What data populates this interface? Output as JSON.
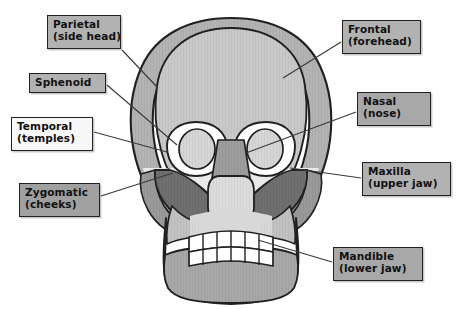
{
  "figure": {
    "width": 462,
    "height": 309,
    "background_color": "#ffffff"
  },
  "palette": {
    "outline": "#231f20",
    "leader_line": "#3a3a3a",
    "label_fill_gray": "#b2b2b2",
    "label_fill_dark_gray": "#a0a0a0",
    "label_fill_white": "#f7f7f7",
    "label_text": "#111111",
    "bone_frontal": "#c9c9c9",
    "bone_parietal": "#b3b3b3",
    "bone_temporal": "#9a9a9a",
    "bone_sphenoid": "#8c8c8c",
    "bone_zygomatic": "#6f6f6f",
    "bone_nasal": "#9d9d9d",
    "bone_maxilla": "#c2c2c2",
    "bone_mandible": "#a8a8a8",
    "orbit_rim": "#ffffff",
    "orbit_interior": "#d6d6d6",
    "teeth": "#ffffff"
  },
  "labels": [
    {
      "id": "parietal",
      "name": "Parietal",
      "common": "(side head)",
      "fill": "#b2b2b2",
      "x": 47,
      "y": 15,
      "width": 74,
      "height": 34
    },
    {
      "id": "sphenoid",
      "name": "Sphenoid",
      "common": "",
      "fill": "#b2b2b2",
      "x": 29,
      "y": 73,
      "width": 77,
      "height": 20
    },
    {
      "id": "temporal",
      "name": "Temporal",
      "common": "(temples)",
      "fill": "#f7f7f7",
      "x": 11,
      "y": 117,
      "width": 82,
      "height": 34
    },
    {
      "id": "zygomatic",
      "name": "Zygomatic",
      "common": "(cheeks)",
      "fill": "#a0a0a0",
      "x": 19,
      "y": 183,
      "width": 81,
      "height": 34
    },
    {
      "id": "frontal",
      "name": "Frontal",
      "common": "(forehead)",
      "fill": "#b2b2b2",
      "x": 342,
      "y": 20,
      "width": 79,
      "height": 34
    },
    {
      "id": "nasal",
      "name": "Nasal",
      "common": "(nose)",
      "fill": "#a8a8a8",
      "x": 357,
      "y": 92,
      "width": 74,
      "height": 34
    },
    {
      "id": "maxilla",
      "name": "Maxilla",
      "common": "(upper jaw)",
      "fill": "#b2b2b2",
      "x": 362,
      "y": 162,
      "width": 89,
      "height": 34
    },
    {
      "id": "mandible",
      "name": "Mandible",
      "common": "(lower jaw)",
      "fill": "#a8a8a8",
      "x": 333,
      "y": 247,
      "width": 90,
      "height": 34
    }
  ],
  "leader_lines": [
    {
      "id": "parietal-leader",
      "x1": 122,
      "y1": 50,
      "x2": 158,
      "y2": 88
    },
    {
      "id": "sphenoid-leader",
      "x1": 107,
      "y1": 85,
      "x2": 177,
      "y2": 145
    },
    {
      "id": "temporal-leader",
      "x1": 94,
      "y1": 132,
      "x2": 167,
      "y2": 152
    },
    {
      "id": "zygomatic-leader",
      "x1": 101,
      "y1": 196,
      "x2": 173,
      "y2": 173
    },
    {
      "id": "frontal-leader",
      "x1": 341,
      "y1": 42,
      "x2": 283,
      "y2": 78
    },
    {
      "id": "nasal-leader",
      "x1": 356,
      "y1": 112,
      "x2": 246,
      "y2": 153
    },
    {
      "id": "maxilla-leader",
      "x1": 361,
      "y1": 178,
      "x2": 290,
      "y2": 168
    },
    {
      "id": "mandible-leader",
      "x1": 332,
      "y1": 262,
      "x2": 258,
      "y2": 240
    }
  ]
}
